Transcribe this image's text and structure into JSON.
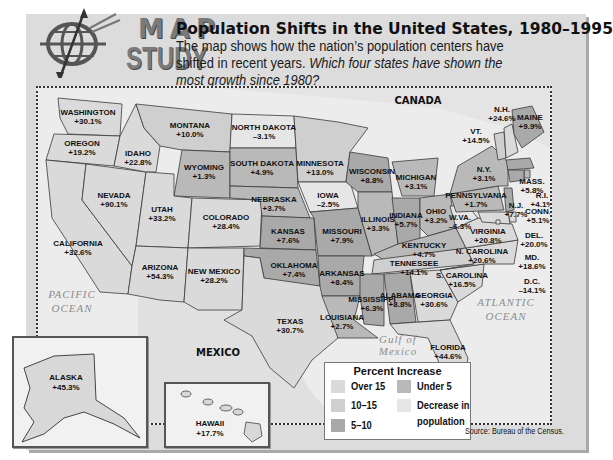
{
  "header": {
    "logo_top": "MAP",
    "logo_bottom": "STUDY",
    "title": "Population Shifts in the United States, 1980–1995",
    "subtitle_plain": "The map shows how the nation’s population centers have shifted in recent years. ",
    "subtitle_question": "Which four states have shown the most growth since 1980?"
  },
  "map_labels": {
    "canada": "CANADA",
    "mexico": "MEXICO",
    "pacific_1": "PACIFIC",
    "pacific_2": "OCEAN",
    "atlantic_1": "ATLANTIC",
    "atlantic_2": "OCEAN",
    "gulf_1": "Gulf of",
    "gulf_2": "Mexico"
  },
  "colors": {
    "over15": "#dadada",
    "10to15": "#cfcfcf",
    "5to10": "#a9a9a9",
    "under5": "#b9b9b9",
    "decrease": "#e6e6e6",
    "border": "#3a3a3a"
  },
  "states": [
    {
      "name": "WASHINGTON",
      "value": "+30.1%",
      "cat": "over15"
    },
    {
      "name": "OREGON",
      "value": "+19.2%",
      "cat": "over15"
    },
    {
      "name": "CALIFORNIA",
      "value": "+32.6%",
      "cat": "over15"
    },
    {
      "name": "NEVADA",
      "value": "+90.1%",
      "cat": "over15"
    },
    {
      "name": "IDAHO",
      "value": "+22.8%",
      "cat": "over15"
    },
    {
      "name": "MONTANA",
      "value": "+10.0%",
      "cat": "10to15"
    },
    {
      "name": "WYOMING",
      "value": "+1.3%",
      "cat": "under5"
    },
    {
      "name": "UTAH",
      "value": "+33.2%",
      "cat": "over15"
    },
    {
      "name": "ARIZONA",
      "value": "+54.3%",
      "cat": "over15"
    },
    {
      "name": "COLORADO",
      "value": "+28.4%",
      "cat": "over15"
    },
    {
      "name": "NEW MEXICO",
      "value": "+28.2%",
      "cat": "over15"
    },
    {
      "name": "NORTH DAKOTA",
      "value": "–3.1%",
      "cat": "decrease"
    },
    {
      "name": "SOUTH DAKOTA",
      "value": "+4.9%",
      "cat": "under5"
    },
    {
      "name": "NEBRASKA",
      "value": "+3.7%",
      "cat": "under5"
    },
    {
      "name": "KANSAS",
      "value": "+7.6%",
      "cat": "5to10"
    },
    {
      "name": "OKLAHOMA",
      "value": "+7.4%",
      "cat": "5to10"
    },
    {
      "name": "TEXAS",
      "value": "+30.7%",
      "cat": "over15"
    },
    {
      "name": "MINNESOTA",
      "value": "+13.0%",
      "cat": "10to15"
    },
    {
      "name": "IOWA",
      "value": "–2.5%",
      "cat": "decrease"
    },
    {
      "name": "MISSOURI",
      "value": "+7.9%",
      "cat": "5to10"
    },
    {
      "name": "ARKANSAS",
      "value": "+8.4%",
      "cat": "5to10"
    },
    {
      "name": "LOUISIANA",
      "value": "+2.7%",
      "cat": "under5"
    },
    {
      "name": "WISCONSIN",
      "value": "+8.8%",
      "cat": "5to10"
    },
    {
      "name": "ILLINOIS",
      "value": "+3.3%",
      "cat": "under5"
    },
    {
      "name": "MICHIGAN",
      "value": "+3.1%",
      "cat": "under5"
    },
    {
      "name": "INDIANA",
      "value": "+5.7%",
      "cat": "5to10"
    },
    {
      "name": "OHIO",
      "value": "+3.2%",
      "cat": "under5"
    },
    {
      "name": "KENTUCKY",
      "value": "+4.7%",
      "cat": "under5"
    },
    {
      "name": "TENNESSEE",
      "value": "+14.1%",
      "cat": "10to15"
    },
    {
      "name": "MISSISSIPPI",
      "value": "+6.3%",
      "cat": "5to10"
    },
    {
      "name": "ALABAMA",
      "value": "+8.8%",
      "cat": "5to10"
    },
    {
      "name": "GEORGIA",
      "value": "+30.6%",
      "cat": "over15"
    },
    {
      "name": "FLORIDA",
      "value": "+44.6%",
      "cat": "over15"
    },
    {
      "name": "S. CAROLINA",
      "value": "+16.5%",
      "cat": "over15"
    },
    {
      "name": "N. CAROLINA",
      "value": "+20.6%",
      "cat": "over15"
    },
    {
      "name": "VIRGINIA",
      "value": "+20.8%",
      "cat": "over15"
    },
    {
      "name": "W.VA.",
      "value": "–6.3%",
      "cat": "decrease"
    },
    {
      "name": "PENNSYLVANIA",
      "value": "+1.7%",
      "cat": "under5"
    },
    {
      "name": "N.Y.",
      "value": "+3.1%",
      "cat": "under5"
    },
    {
      "name": "VT.",
      "value": "+14.5%",
      "cat": "10to15"
    },
    {
      "name": "N.H.",
      "value": "+24.6%",
      "cat": "over15"
    },
    {
      "name": "MAINE",
      "value": "+9.9%",
      "cat": "5to10"
    },
    {
      "name": "MASS.",
      "value": "+5.8%",
      "cat": "5to10"
    },
    {
      "name": "R.I.",
      "value": "+4.1%",
      "cat": "under5"
    },
    {
      "name": "CONN.",
      "value": "+5.1%",
      "cat": "5to10"
    },
    {
      "name": "N.J.",
      "value": "+7.7%",
      "cat": "5to10"
    },
    {
      "name": "DEL.",
      "value": "+20.0%",
      "cat": "over15"
    },
    {
      "name": "MD.",
      "value": "+18.6%",
      "cat": "over15"
    },
    {
      "name": "D.C.",
      "value": "–14.1%",
      "cat": "decrease"
    },
    {
      "name": "ALASKA",
      "value": "+45.3%",
      "cat": "over15"
    },
    {
      "name": "HAWAII",
      "value": "+17.7%",
      "cat": "over15"
    }
  ],
  "legend": {
    "title": "Percent Increase",
    "items": [
      {
        "label": "Over 15",
        "cat": "over15"
      },
      {
        "label": "10–15",
        "cat": "10to15"
      },
      {
        "label": "5–10",
        "cat": "5to10"
      },
      {
        "label": "Under 5",
        "cat": "under5"
      },
      {
        "label": "Decrease in",
        "label2": "population",
        "cat": "decrease"
      }
    ]
  },
  "source": "Source: Bureau of the Census."
}
